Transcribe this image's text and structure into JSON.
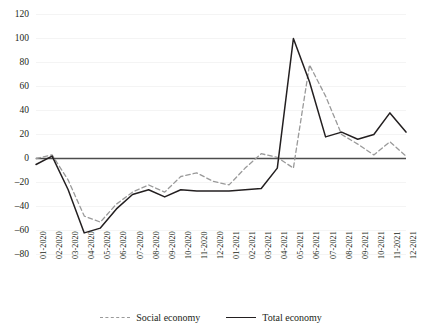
{
  "chart_data": {
    "type": "line",
    "title": "",
    "subtitle": "",
    "xlabel": "",
    "ylabel": "",
    "ylim": [
      -80,
      120
    ],
    "ytick_step": 20,
    "yticks": [
      120,
      100,
      80,
      60,
      40,
      20,
      0,
      -20,
      -40,
      -60,
      -80
    ],
    "ytick_labels": [
      "120",
      "100",
      "80",
      "60",
      "40",
      "20",
      "0",
      "–20",
      "–40",
      "–60",
      "–80"
    ],
    "grid": true,
    "grid_axis": "y-minor-faint",
    "legend_position": "bottom-center",
    "categories": [
      "01-2020",
      "02-2020",
      "03-2020",
      "04-2020",
      "05-2020",
      "06-2020",
      "07-2020",
      "08-2020",
      "09-2020",
      "10-2020",
      "11-2020",
      "12-2020",
      "01-2021",
      "02-2021",
      "03-2021",
      "04-2021",
      "05-2021",
      "06-2021",
      "07-2021",
      "08-2021",
      "09-2021",
      "10-2021",
      "11-2021",
      "12-2021"
    ],
    "series": [
      {
        "name": "Social economy",
        "style": "dashed",
        "color": "#9a9a9a",
        "values": [
          0,
          3,
          -18,
          -48,
          -53,
          -38,
          -28,
          -22,
          -28,
          -15,
          -12,
          -19,
          -22,
          -8,
          4,
          1,
          -8,
          78,
          52,
          20,
          12,
          3,
          14,
          2
        ]
      },
      {
        "name": "Total economy",
        "style": "solid",
        "color": "#231f20",
        "values": [
          -5,
          2,
          -26,
          -62,
          -58,
          -42,
          -30,
          -26,
          -32,
          -26,
          -27,
          -27,
          -27,
          -26,
          -25,
          -8,
          100,
          64,
          18,
          22,
          16,
          20,
          38,
          22
        ]
      }
    ]
  },
  "legend": {
    "items": [
      {
        "label": "Social economy",
        "style": "dashed"
      },
      {
        "label": "Total economy",
        "style": "solid"
      }
    ]
  },
  "colors": {
    "social_economy": "#9a9a9a",
    "total_economy": "#231f20",
    "zero_line": "#4d4d4d",
    "grid": "#ededed",
    "text": "#231f20",
    "background": "#ffffff"
  }
}
